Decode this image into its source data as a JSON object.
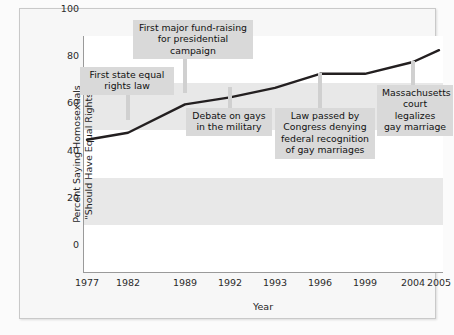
{
  "chart_data": {
    "type": "line",
    "title": "",
    "xlabel": "Year",
    "ylabel": "Percent Saying Homosexuals \"Should Have Equal Rights\"",
    "ylabel_line1": "Percent Saying Homosexuals",
    "ylabel_line2": "\"Should Have Equal Rights\"",
    "x": [
      "1977",
      "1982",
      "1989",
      "1992",
      "1993",
      "1996",
      "1999",
      "2004",
      "2005"
    ],
    "categories": [
      "1977",
      "1982",
      "1989",
      "1992",
      "1993",
      "1996",
      "1999",
      "2004",
      "2005"
    ],
    "values": [
      56,
      59,
      71,
      74,
      78,
      84,
      84,
      89,
      94
    ],
    "series": [
      {
        "name": "Percent saying homosexuals should have equal rights",
        "values": [
          56,
          59,
          71,
          74,
          78,
          84,
          84,
          89,
          94
        ]
      }
    ],
    "yticks": [
      "0",
      "20",
      "40",
      "60",
      "80",
      "100"
    ],
    "ytick_values": [
      0,
      20,
      40,
      60,
      80,
      100
    ],
    "ylim": [
      0,
      100
    ],
    "grid": "alternating-horizontal-bands",
    "legend": "none",
    "line_color": "#231f20",
    "band_color": "#e8e8e8",
    "annotation_bg": "#d9d9d9",
    "annotations": [
      {
        "id": "first-state-equal-rights-law",
        "text": "First state equal\nrights law",
        "points_to_year": "1982",
        "points_to_value": 59
      },
      {
        "id": "first-major-fund-raising",
        "text": "First major fund-raising\nfor presidential campaign",
        "points_to_year": "1989",
        "points_to_value": 71
      },
      {
        "id": "debate-on-gays-in-the-military",
        "text": "Debate on gays\nin the military",
        "points_to_year": "1992",
        "points_to_value": 74
      },
      {
        "id": "law-denying-federal-recognition",
        "text": "Law passed by\nCongress denying\nfederal recognition\nof gay marriages",
        "points_to_year": "1996",
        "points_to_value": 84
      },
      {
        "id": "massachusetts-court-legalizes",
        "text": "Massachusetts\ncourt legalizes\ngay marriage",
        "points_to_year": "2004",
        "points_to_value": 89
      }
    ]
  }
}
